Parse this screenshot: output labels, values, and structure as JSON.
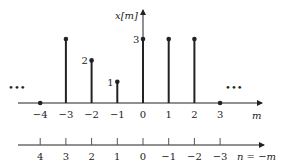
{
  "chart_data": {
    "type": "stem",
    "title": "",
    "ylabel": "x[m]",
    "xlabel": "m",
    "x": [
      -4,
      -3,
      -2,
      -1,
      0,
      1,
      2,
      3
    ],
    "values": [
      0,
      3,
      2,
      1,
      3,
      3,
      3,
      0
    ],
    "value_labels": [
      {
        "m": -2,
        "label": "2"
      },
      {
        "m": -1,
        "label": "1"
      },
      {
        "m": 0,
        "label": "3"
      }
    ],
    "continuation_left": "•••",
    "continuation_right": "•••",
    "tick_labels_m": [
      "−4",
      "−3",
      "−2",
      "−1",
      "0",
      "1",
      "2",
      "3"
    ],
    "second_axis": {
      "label": "n = −m",
      "tick_labels": [
        "4",
        "3",
        "2",
        "1",
        "0",
        "−1",
        "−2",
        "−3"
      ]
    }
  },
  "labels": {
    "y_axis": "x[m]",
    "x_axis": "m",
    "n_axis": "n = −m",
    "dots": "•••"
  }
}
